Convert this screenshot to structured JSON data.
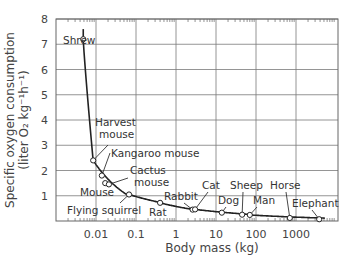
{
  "chart_data": {
    "type": "line",
    "title": "",
    "xlabel": "Body mass (kg)",
    "ylabel": "Specific oxygen consumption",
    "ylabel_units": "(liter O₂ kg⁻¹h⁻¹)",
    "x_scale": "log",
    "xlim": [
      0.001,
      10000
    ],
    "ylim": [
      0,
      8
    ],
    "x_ticks": [
      0.01,
      0.1,
      1,
      10,
      100,
      1000
    ],
    "x_tick_labels": [
      "0.01",
      "0.1",
      "1",
      "10",
      "100",
      "1000"
    ],
    "y_ticks": [
      1,
      2,
      3,
      4,
      5,
      6,
      7,
      8
    ],
    "y_tick_labels": [
      "1",
      "2",
      "3",
      "4",
      "5",
      "6",
      "7",
      "8"
    ],
    "grid": true,
    "legend": null,
    "series": [
      {
        "name": "Mammals",
        "points": [
          {
            "label": "Shrew",
            "x": 0.0048,
            "y": 7.2
          },
          {
            "label": "Harvest mouse",
            "x": 0.0085,
            "y": 2.4
          },
          {
            "label": "Kangaroo mouse",
            "x": 0.014,
            "y": 1.8
          },
          {
            "label": "Mouse",
            "x": 0.017,
            "y": 1.5
          },
          {
            "label": "Cactus mouse",
            "x": 0.021,
            "y": 1.45
          },
          {
            "label": "Flying squirrel",
            "x": 0.067,
            "y": 1.05
          },
          {
            "label": "Rat",
            "x": 0.4,
            "y": 0.72
          },
          {
            "label": "Rabbit",
            "x": 2.6,
            "y": 0.45
          },
          {
            "label": "Cat",
            "x": 3.0,
            "y": 0.46
          },
          {
            "label": "Dog",
            "x": 14,
            "y": 0.33
          },
          {
            "label": "Sheep",
            "x": 45,
            "y": 0.25
          },
          {
            "label": "Man",
            "x": 70,
            "y": 0.24
          },
          {
            "label": "Horse",
            "x": 700,
            "y": 0.12
          },
          {
            "label": "Elephant",
            "x": 3800,
            "y": 0.07
          }
        ]
      }
    ],
    "annotations": [
      {
        "text": "Shrew",
        "tx": 63,
        "ty": 44,
        "px": 0.0048,
        "py": 7.2,
        "leader": false
      },
      {
        "text": "Harvest",
        "tx": 95,
        "ty": 126,
        "line2": "mouse",
        "px": 0.0085,
        "py": 2.4,
        "leader": true,
        "lx": 108,
        "ly": 145
      },
      {
        "text": "Kangaroo mouse",
        "tx": 111,
        "ty": 157,
        "px": 0.014,
        "py": 1.8,
        "leader": true,
        "lx": 110,
        "ly": 153
      },
      {
        "text": "Cactus",
        "tx": 130,
        "ty": 174,
        "line2": "mouse",
        "px": 0.021,
        "py": 1.45,
        "leader": true,
        "lx": 128,
        "ly": 178
      },
      {
        "text": "Mouse",
        "tx": 80,
        "ty": 196,
        "px": 0.017,
        "py": 1.5,
        "leader": false
      },
      {
        "text": "Flying squirrel",
        "tx": 67,
        "ty": 214,
        "px": 0.067,
        "py": 1.05,
        "leader": true,
        "lx": 120,
        "ly": 203
      },
      {
        "text": "Rat",
        "tx": 149,
        "ty": 216,
        "px": 0.4,
        "py": 0.72,
        "leader": false
      },
      {
        "text": "Rabbit",
        "tx": 164,
        "ty": 200,
        "px": 2.6,
        "py": 0.45,
        "leader": true,
        "lx": 184,
        "ly": 203
      },
      {
        "text": "Cat",
        "tx": 202,
        "ty": 189,
        "px": 3.0,
        "py": 0.46,
        "leader": true,
        "lx": 208,
        "ly": 192
      },
      {
        "text": "Dog",
        "tx": 218,
        "ty": 204,
        "px": 14,
        "py": 0.33,
        "leader": true,
        "lx": 226,
        "ly": 207
      },
      {
        "text": "Sheep",
        "tx": 230,
        "ty": 189,
        "px": 45,
        "py": 0.25,
        "leader": true,
        "lx": 243,
        "ly": 192
      },
      {
        "text": "Man",
        "tx": 253,
        "ty": 204,
        "px": 70,
        "py": 0.24,
        "leader": true,
        "lx": 257,
        "ly": 207
      },
      {
        "text": "Horse",
        "tx": 270,
        "ty": 189,
        "px": 700,
        "py": 0.12,
        "leader": true,
        "lx": 286,
        "ly": 192
      },
      {
        "text": "Elephant",
        "tx": 292,
        "ty": 207,
        "px": 3800,
        "py": 0.07,
        "leader": true,
        "lx": 312,
        "ly": 210
      }
    ]
  },
  "layout": {
    "plot_left": 56,
    "plot_right": 338,
    "plot_top": 19,
    "plot_bottom": 221,
    "decade_px": 40
  }
}
